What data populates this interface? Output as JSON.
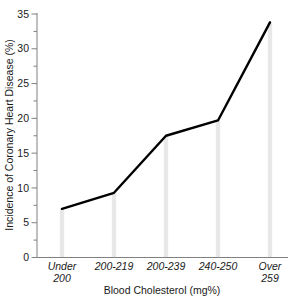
{
  "chart_data": {
    "type": "line",
    "title": "",
    "xlabel": "Blood Cholesterol (mg%)",
    "ylabel": "Incidence of Coronary Heart Disease (%)",
    "categories": [
      "Under 200",
      "200-219",
      "200-239",
      "240-250",
      "Over 259"
    ],
    "category_lines": [
      [
        "Under",
        "200"
      ],
      [
        "200-219",
        ""
      ],
      [
        "200-239",
        ""
      ],
      [
        "240-250",
        ""
      ],
      [
        "Over",
        "259"
      ]
    ],
    "values": [
      7.0,
      9.3,
      17.5,
      19.7,
      33.8
    ],
    "ylim": [
      0,
      35
    ],
    "ytick_values": [
      0,
      5,
      10,
      15,
      20,
      25,
      30,
      35
    ],
    "ytick_labels": [
      "0",
      "5",
      "10",
      "15",
      "20",
      "25",
      "30",
      "35"
    ],
    "yminor_values": [
      2.5,
      7.5,
      12.5,
      17.5,
      22.5,
      27.5,
      32.5
    ],
    "grid": false,
    "legend": "none",
    "series_name": "Incidence of Coronary Heart Disease",
    "marker_bars": true,
    "colors": {
      "line": "#000000",
      "bar": "#e8e8e8",
      "axis": "#808080",
      "text": "#1a1a1a",
      "background": "#ffffff"
    }
  }
}
